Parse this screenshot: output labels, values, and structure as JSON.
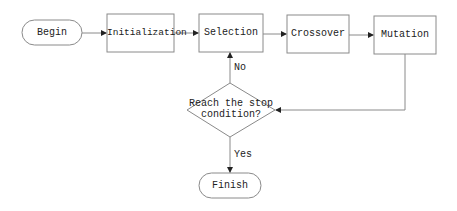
{
  "diagram": {
    "type": "flowchart",
    "nodes": {
      "begin": "Begin",
      "initialization": "Initialization",
      "selection": "Selection",
      "crossover": "Crossover",
      "mutation": "Mutation",
      "decision_line1": "Reach the stop",
      "decision_line2": "condition?",
      "finish": "Finish"
    },
    "edges": {
      "no_label": "No",
      "yes_label": "Yes"
    },
    "colors": {
      "stroke": "#8a8a8a",
      "text": "#222222"
    }
  }
}
